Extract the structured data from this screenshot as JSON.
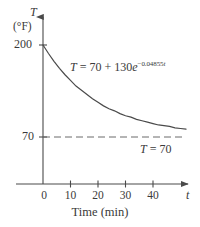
{
  "chart_data": {
    "type": "line",
    "title": "",
    "xlabel": "Time (min)",
    "ylabel": "T",
    "y_unit": "(°F)",
    "x_axis_symbol": "t",
    "y_axis_symbol": "T",
    "xlim": [
      0,
      52
    ],
    "ylim": [
      0,
      215
    ],
    "grid": false,
    "legend": "none",
    "x_ticks": [
      {
        "value": 0,
        "label": "0"
      },
      {
        "value": 10,
        "label": "10"
      },
      {
        "value": 20,
        "label": "20"
      },
      {
        "value": 30,
        "label": "30"
      },
      {
        "value": 40,
        "label": "40"
      }
    ],
    "y_ticks": [
      {
        "value": 200,
        "label": "200"
      },
      {
        "value": 70,
        "label": "70"
      }
    ],
    "series": [
      {
        "name": "cooling-curve",
        "style": "solid",
        "color": "#4a4a4a",
        "equation": "T = 70 + 130e^(-0.04855t)",
        "ambient": 70,
        "initial_excess": 130,
        "decay_rate": 0.04855,
        "x": [
          0,
          2,
          4,
          6,
          8,
          10,
          12,
          14,
          16,
          18,
          20,
          22,
          24,
          26,
          28,
          30,
          32,
          34,
          36,
          38,
          40,
          42,
          44,
          46,
          48,
          50,
          52
        ],
        "values": [
          200,
          188,
          177,
          167,
          158,
          150,
          142,
          136,
          130,
          124,
          119,
          114,
          110,
          107,
          103,
          100,
          98,
          95,
          93,
          91,
          89,
          87,
          86,
          85,
          83,
          82,
          81
        ]
      },
      {
        "name": "asymptote",
        "style": "dashed",
        "color": "#6a6a6a",
        "constant_value": 70,
        "x": [
          0,
          52
        ],
        "values": [
          70,
          70
        ]
      }
    ],
    "annotations": [
      {
        "id": "curve-equation",
        "prefix": "T",
        "body": " = 70 + 130",
        "base": "e",
        "exponent_sign": "−",
        "exponent_value": "0.04855",
        "exponent_var": "t",
        "full_text": "T = 70 + 130e−0.04855t"
      },
      {
        "id": "asymptote-label",
        "var": "T",
        "rest": " = 70",
        "full_text": "T = 70"
      }
    ],
    "axis_arrowheads": true,
    "background_color": "#ffffff",
    "axis_color": "#4a4a4a"
  }
}
